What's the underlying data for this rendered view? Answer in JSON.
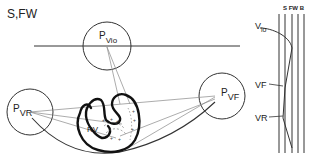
{
  "title": "S,FW",
  "nodes": {
    "pvio": {
      "main": "P",
      "sub": "Vio"
    },
    "pvr": {
      "main": "P",
      "sub": "VR"
    },
    "pvf": {
      "main": "P",
      "sub": "VF"
    }
  },
  "heart": {
    "chamber_label": "RV"
  },
  "panel": {
    "header": "S FW B",
    "labels": [
      {
        "main": "V",
        "sub": "io"
      },
      {
        "main": "VF",
        "sub": ""
      },
      {
        "main": "VR",
        "sub": ""
      }
    ]
  },
  "colors": {
    "ink": "#222222",
    "thin_line": "#777777",
    "background": "#ffffff"
  }
}
